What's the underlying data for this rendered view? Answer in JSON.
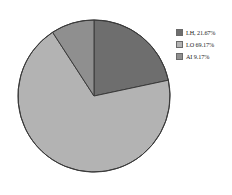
{
  "chart_data": {
    "type": "pie",
    "title": "",
    "categories": [
      "LH",
      "LO",
      "AI"
    ],
    "values": [
      21.67,
      69.17,
      9.17
    ],
    "labels": [
      "LH, 21.67%",
      "LO 69.17%",
      "AI 9.17%"
    ],
    "colors": [
      "#6e6e6e",
      "#b3b3b3",
      "#8f8f8f"
    ],
    "units": "%",
    "start_angle_deg": 0,
    "direction": "clockwise",
    "legend_position": "right",
    "grid": false
  },
  "legend": {
    "items": [
      {
        "label": "LH, 21.67%",
        "color": "#6e6e6e",
        "name": "lh"
      },
      {
        "label": "LO 69.17%",
        "color": "#b3b3b3",
        "name": "lo"
      },
      {
        "label": "AI 9.17%",
        "color": "#8f8f8f",
        "name": "ai"
      }
    ]
  },
  "pie": {
    "center_x": 78,
    "center_y": 78,
    "radius": 76,
    "outline_color": "#3a3a3a"
  }
}
